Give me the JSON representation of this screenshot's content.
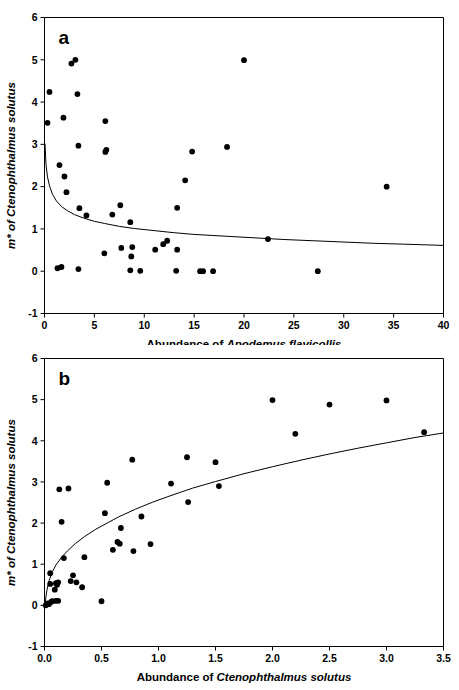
{
  "figure": {
    "title": "",
    "background": "#ffffff",
    "point_color": "#000000",
    "curve_color": "#000000",
    "axis_color": "#000000"
  },
  "chart_data": [
    {
      "type": "scatter",
      "panel_label": "a",
      "title": "",
      "xlabel_plain": "Abundance of ",
      "xlabel_sci": "Apodemus flavicollis",
      "ylabel_sci": "m* of Ctenophthalmus solutus",
      "xlim": [
        0,
        40
      ],
      "ylim": [
        -1,
        6
      ],
      "xticks": [
        0,
        5,
        10,
        15,
        20,
        25,
        30,
        35,
        40
      ],
      "xtick_labels": [
        "0",
        "5",
        "10",
        "15",
        "20",
        "25",
        "30",
        "35",
        "40"
      ],
      "yticks": [
        -1,
        0,
        1,
        2,
        3,
        4,
        5,
        6
      ],
      "ytick_labels": [
        "-1",
        "0",
        "1",
        "2",
        "3",
        "4",
        "5",
        "6"
      ],
      "grid": false,
      "legend": false,
      "points": [
        [
          0.3,
          3.51
        ],
        [
          0.5,
          4.24
        ],
        [
          1.3,
          0.07
        ],
        [
          1.5,
          2.51
        ],
        [
          1.7,
          0.1
        ],
        [
          1.9,
          3.63
        ],
        [
          2.0,
          2.24
        ],
        [
          2.2,
          1.87
        ],
        [
          2.7,
          4.91
        ],
        [
          3.1,
          5.0
        ],
        [
          3.3,
          4.19
        ],
        [
          3.4,
          0.05
        ],
        [
          3.4,
          2.97
        ],
        [
          3.5,
          1.49
        ],
        [
          4.2,
          1.32
        ],
        [
          6.0,
          0.42
        ],
        [
          6.1,
          3.55
        ],
        [
          6.1,
          2.82
        ],
        [
          6.2,
          2.87
        ],
        [
          6.8,
          1.34
        ],
        [
          7.6,
          1.56
        ],
        [
          7.7,
          0.55
        ],
        [
          8.6,
          0.02
        ],
        [
          8.6,
          1.16
        ],
        [
          8.7,
          0.35
        ],
        [
          8.8,
          0.57
        ],
        [
          9.6,
          0.01
        ],
        [
          11.1,
          0.51
        ],
        [
          11.9,
          0.64
        ],
        [
          12.3,
          0.72
        ],
        [
          13.2,
          0.01
        ],
        [
          13.3,
          0.51
        ],
        [
          13.3,
          1.5
        ],
        [
          14.1,
          2.15
        ],
        [
          14.8,
          2.83
        ],
        [
          15.6,
          0.0
        ],
        [
          15.9,
          0.0
        ],
        [
          16.9,
          0.0
        ],
        [
          18.3,
          2.94
        ],
        [
          20.0,
          4.99
        ],
        [
          22.4,
          0.76
        ],
        [
          27.4,
          0.0
        ],
        [
          34.3,
          2.0
        ]
      ],
      "fit_curve": {
        "description": "decaying power-law fit",
        "points": [
          [
            0.05,
            3.02
          ],
          [
            0.15,
            2.52
          ],
          [
            0.3,
            2.23
          ],
          [
            0.5,
            2.02
          ],
          [
            0.8,
            1.82
          ],
          [
            1.2,
            1.66
          ],
          [
            1.7,
            1.53
          ],
          [
            2.3,
            1.43
          ],
          [
            3.0,
            1.34
          ],
          [
            4.0,
            1.25
          ],
          [
            5.0,
            1.18
          ],
          [
            6.0,
            1.13
          ],
          [
            7.5,
            1.06
          ],
          [
            9.0,
            1.01
          ],
          [
            11.0,
            0.96
          ],
          [
            13.0,
            0.91
          ],
          [
            15.0,
            0.87
          ],
          [
            18.0,
            0.83
          ],
          [
            21.0,
            0.79
          ],
          [
            24.0,
            0.75
          ],
          [
            27.0,
            0.72
          ],
          [
            30.0,
            0.69
          ],
          [
            33.0,
            0.66
          ],
          [
            36.0,
            0.64
          ],
          [
            40.0,
            0.61
          ]
        ]
      }
    },
    {
      "type": "scatter",
      "panel_label": "b",
      "title": "",
      "xlabel_plain": "Abundance of ",
      "xlabel_sci": "Ctenophthalmus solutus",
      "ylabel_sci": "m* of Ctenophthalmus solutus",
      "xlim": [
        0,
        3.5
      ],
      "ylim": [
        -1,
        6
      ],
      "xticks": [
        0,
        0.5,
        1.0,
        1.5,
        2.0,
        2.5,
        3.0,
        3.5
      ],
      "xtick_labels": [
        "0.0",
        "0.5",
        "1.0",
        "1.5",
        "2.0",
        "2.5",
        "3.0",
        "3.5"
      ],
      "yticks": [
        -1,
        0,
        1,
        2,
        3,
        4,
        5,
        6
      ],
      "ytick_labels": [
        "-1",
        "0",
        "1",
        "2",
        "3",
        "4",
        "5",
        "6"
      ],
      "grid": false,
      "legend": false,
      "points": [
        [
          0.01,
          0.0
        ],
        [
          0.02,
          0.02
        ],
        [
          0.03,
          0.05
        ],
        [
          0.04,
          0.03
        ],
        [
          0.05,
          0.52
        ],
        [
          0.05,
          0.78
        ],
        [
          0.06,
          0.09
        ],
        [
          0.07,
          0.1
        ],
        [
          0.09,
          0.38
        ],
        [
          0.1,
          0.54
        ],
        [
          0.1,
          0.11
        ],
        [
          0.11,
          0.5
        ],
        [
          0.12,
          0.56
        ],
        [
          0.12,
          0.11
        ],
        [
          0.13,
          2.82
        ],
        [
          0.15,
          2.03
        ],
        [
          0.17,
          1.15
        ],
        [
          0.21,
          2.84
        ],
        [
          0.23,
          0.59
        ],
        [
          0.25,
          0.73
        ],
        [
          0.28,
          0.56
        ],
        [
          0.33,
          0.44
        ],
        [
          0.35,
          1.17
        ],
        [
          0.5,
          0.1
        ],
        [
          0.53,
          2.24
        ],
        [
          0.55,
          2.98
        ],
        [
          0.6,
          1.35
        ],
        [
          0.64,
          1.54
        ],
        [
          0.66,
          1.5
        ],
        [
          0.67,
          1.88
        ],
        [
          0.77,
          3.54
        ],
        [
          0.78,
          1.32
        ],
        [
          0.85,
          2.16
        ],
        [
          0.93,
          1.49
        ],
        [
          1.11,
          2.96
        ],
        [
          1.25,
          3.6
        ],
        [
          1.26,
          2.51
        ],
        [
          1.5,
          3.48
        ],
        [
          1.53,
          2.9
        ],
        [
          2.0,
          4.99
        ],
        [
          2.2,
          4.17
        ],
        [
          2.5,
          4.88
        ],
        [
          3.0,
          4.98
        ],
        [
          3.33,
          4.21
        ]
      ],
      "fit_curve": {
        "description": "increasing log/power fit",
        "points": [
          [
            0.005,
            0.0
          ],
          [
            0.01,
            0.15
          ],
          [
            0.02,
            0.35
          ],
          [
            0.04,
            0.6
          ],
          [
            0.07,
            0.82
          ],
          [
            0.1,
            0.98
          ],
          [
            0.15,
            1.17
          ],
          [
            0.2,
            1.32
          ],
          [
            0.27,
            1.5
          ],
          [
            0.35,
            1.67
          ],
          [
            0.45,
            1.85
          ],
          [
            0.55,
            2.0
          ],
          [
            0.65,
            2.15
          ],
          [
            0.8,
            2.34
          ],
          [
            0.95,
            2.51
          ],
          [
            1.1,
            2.66
          ],
          [
            1.3,
            2.85
          ],
          [
            1.5,
            3.01
          ],
          [
            1.75,
            3.2
          ],
          [
            2.0,
            3.37
          ],
          [
            2.25,
            3.53
          ],
          [
            2.5,
            3.68
          ],
          [
            2.75,
            3.82
          ],
          [
            3.0,
            3.95
          ],
          [
            3.25,
            4.08
          ],
          [
            3.5,
            4.19
          ]
        ]
      }
    }
  ]
}
